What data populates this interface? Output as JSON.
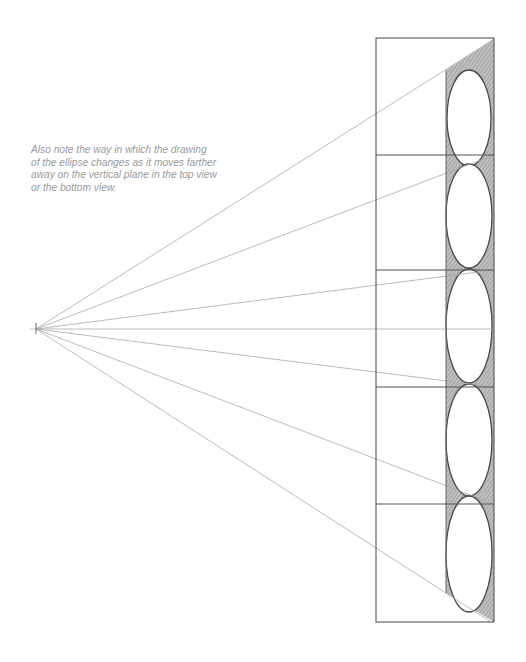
{
  "caption": {
    "lines": [
      "Also note the way in which the drawing",
      "of the ellipse changes as it moves farther",
      "away on the vertical plane in the top view",
      "or the bottom view."
    ]
  },
  "drawing": {
    "vanishing_point": {
      "x": 36,
      "y": 329
    },
    "outer_box": {
      "left": 376,
      "top": 38,
      "right": 494,
      "bottom": 622
    },
    "dividers_y": [
      155,
      270,
      387,
      504
    ],
    "strip": {
      "left": 446,
      "right": 494
    },
    "ellipses": [
      {
        "cx": 469,
        "cy": 118,
        "rx": 22,
        "ry": 48
      },
      {
        "cx": 469,
        "cy": 216,
        "rx": 23,
        "ry": 52
      },
      {
        "cx": 469,
        "cy": 326,
        "rx": 23,
        "ry": 57
      },
      {
        "cx": 469,
        "cy": 440,
        "rx": 23,
        "ry": 56
      },
      {
        "cx": 469,
        "cy": 554,
        "rx": 23,
        "ry": 58
      }
    ],
    "colors": {
      "line": "#555555",
      "ray": "#aaaaaa",
      "shade": "#8a8a8a",
      "text": "#9a9a9a"
    }
  }
}
